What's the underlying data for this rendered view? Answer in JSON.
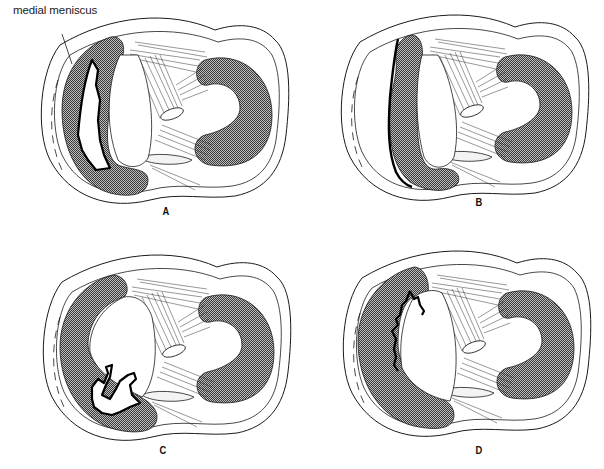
{
  "figure": {
    "callout_label": "medial meniscus",
    "panels": [
      {
        "id": "A",
        "label": "A",
        "description": "longitudinal (bucket-handle) tear within medial meniscus"
      },
      {
        "id": "B",
        "label": "B",
        "description": "peripheral detachment along outer rim of medial meniscus"
      },
      {
        "id": "C",
        "label": "C",
        "description": "complex tear of posterior horn of medial meniscus"
      },
      {
        "id": "D",
        "label": "D",
        "description": "degenerative tear of inner edge of medial meniscus"
      }
    ],
    "colors": {
      "line": "#1a1a1a",
      "shading": "#6b6b6b",
      "background": "#ffffff"
    }
  }
}
